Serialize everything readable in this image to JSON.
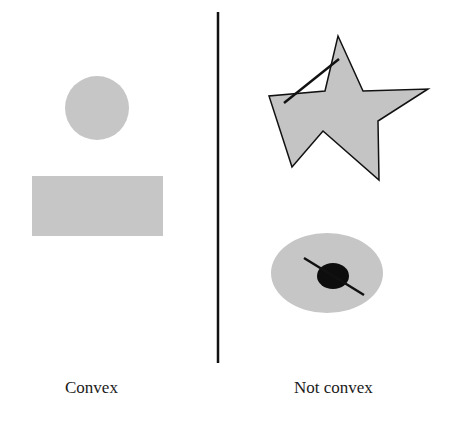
{
  "figure": {
    "labels": {
      "left": "Convex",
      "right": "Not convex"
    },
    "colors": {
      "shape_fill": "#c4c4c4",
      "stroke": "#111111",
      "background": "#ffffff"
    },
    "convex_shapes": [
      "circle",
      "rectangle"
    ],
    "non_convex_shapes": [
      "star-polygon-with-exterior-segment",
      "ellipse-with-hole-and-segment"
    ]
  }
}
